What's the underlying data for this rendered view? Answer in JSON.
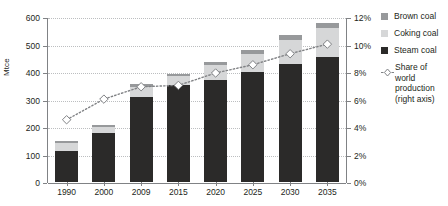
{
  "chart_data": {
    "type": "bar",
    "subtype": "stacked-bar-with-line",
    "title": "",
    "xlabel": "",
    "ylabel": "Mtce",
    "categories": [
      "1990",
      "2000",
      "2009",
      "2015",
      "2020",
      "2025",
      "2030",
      "2035"
    ],
    "ylim": [
      0,
      600
    ],
    "yticks": [
      0,
      100,
      200,
      300,
      400,
      500,
      600
    ],
    "ytick_labels": [
      "0",
      "100",
      "200",
      "300",
      "400",
      "500",
      "600"
    ],
    "y2lim": [
      0,
      12
    ],
    "y2ticks": [
      0,
      2,
      4,
      6,
      8,
      10,
      12
    ],
    "y2tick_labels": [
      "0%",
      "2%",
      "4%",
      "6%",
      "8%",
      "10%",
      "12%"
    ],
    "y2label": "",
    "grid": true,
    "legend_position": "right",
    "series": [
      {
        "name": "Steam coal",
        "type": "bar",
        "color": "#2b2a29",
        "values": [
          112,
          180,
          310,
          352,
          370,
          400,
          430,
          455
        ]
      },
      {
        "name": "Coking coal",
        "type": "bar",
        "color": "#d6d7d8",
        "values": [
          31,
          20,
          35,
          33,
          55,
          65,
          85,
          105
        ]
      },
      {
        "name": "Brown coal",
        "type": "bar",
        "color": "#97999b",
        "values": [
          7,
          8,
          10,
          8,
          12,
          15,
          18,
          20
        ]
      },
      {
        "name": "Share of world production (right axis)",
        "type": "line",
        "axis": "right",
        "color": "#808285",
        "marker": "diamond",
        "linestyle": "dotted",
        "values": [
          4.6,
          6.1,
          7.0,
          7.1,
          8.0,
          8.6,
          9.4,
          10.1
        ]
      }
    ],
    "bar_totals": [
      150,
      208,
      355,
      393,
      437,
      480,
      533,
      580
    ]
  },
  "axes": {
    "y_left_title": "Mtce"
  },
  "legend": {
    "items": [
      {
        "label": "Brown coal",
        "swatch": "#97999b",
        "kind": "swatch"
      },
      {
        "label": "Coking coal",
        "swatch": "#d6d7d8",
        "kind": "swatch"
      },
      {
        "label": "Steam coal",
        "swatch": "#2b2a29",
        "kind": "swatch"
      },
      {
        "label": "Share of world production (right axis)",
        "swatch": "#808285",
        "kind": "marker-line",
        "lines": [
          "Share of world",
          "production",
          "(right axis)"
        ]
      }
    ]
  }
}
